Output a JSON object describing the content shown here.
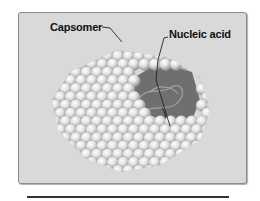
{
  "figure": {
    "labels": {
      "capsomer": "Capsomer",
      "nucleic_acid": "Nucleic acid"
    },
    "colors": {
      "panel_bg": "#d9d9d9",
      "sphere_light": "#f4f4f4",
      "sphere_dark": "#9a9a9a",
      "interior": "#6e6e6e",
      "text": "#111111"
    }
  }
}
